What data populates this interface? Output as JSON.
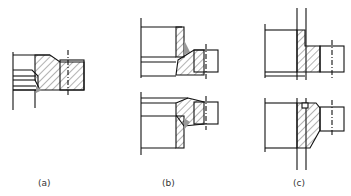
{
  "figure": {
    "labels": {
      "a": "(a)",
      "b": "(b)",
      "c": "(c)"
    },
    "colors": {
      "line": "#111111",
      "weld": "#999999",
      "background": "#ffffff"
    }
  }
}
